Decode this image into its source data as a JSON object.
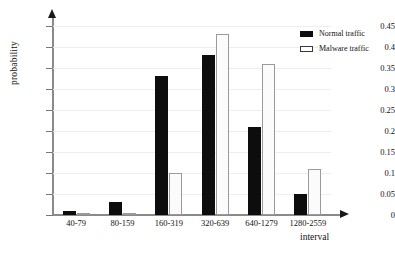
{
  "chart_data": {
    "type": "bar",
    "title": "",
    "xlabel": "interval",
    "ylabel": "probability",
    "categories": [
      "40-79",
      "80-159",
      "160-319",
      "320-639",
      "640-1279",
      "1280-2559"
    ],
    "series": [
      {
        "name": "Normal traffic",
        "color": "#0d0d0d",
        "fill": "solid",
        "values": [
          0.01,
          0.03,
          0.33,
          0.38,
          0.21,
          0.05
        ]
      },
      {
        "name": "Malware traffic",
        "color": "#ffffff",
        "fill": "outline",
        "values": [
          0.002,
          0.002,
          0.1,
          0.43,
          0.36,
          0.11
        ]
      }
    ],
    "ylim": [
      0,
      0.45
    ],
    "ytick_labels": [
      "0",
      "0.05",
      "0.1",
      "0.15",
      "0.2",
      "0.25",
      "0.3",
      "0.35",
      "0.4",
      "0.45"
    ],
    "ytick_values": [
      0,
      0.05,
      0.1,
      0.15,
      0.2,
      0.25,
      0.3,
      0.35,
      0.4,
      0.45
    ],
    "grid": true,
    "grid_color": "#eeeeee",
    "legend_position": "top-right",
    "axis_arrows": true
  }
}
